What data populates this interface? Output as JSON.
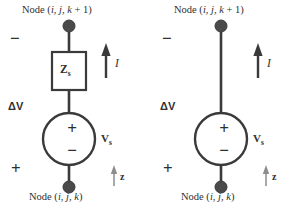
{
  "figure": {
    "type": "circuit-diagram",
    "stroke_color": "#3a3a3a",
    "node_fill_color": "#4a4a4a",
    "background_color": "#ffffff"
  },
  "circuits": [
    {
      "id": "left",
      "has_impedance": true,
      "top_node_label": "Node (i, j, k + 1)",
      "bottom_node_label": "Node (i, j, k)",
      "impedance_label": "Z",
      "impedance_subscript": "s",
      "source_plus": "+",
      "source_minus": "−",
      "source_label": "V",
      "source_subscript": "s",
      "terminal_minus": "−",
      "terminal_plus": "+",
      "delta_v_label": "ΔV",
      "current_label": "I",
      "axis_label": "z"
    },
    {
      "id": "right",
      "has_impedance": false,
      "top_node_label": "Node (i, j, k + 1)",
      "bottom_node_label": "Node (i, j, k)",
      "impedance_label": "",
      "impedance_subscript": "",
      "source_plus": "+",
      "source_minus": "−",
      "source_label": "V",
      "source_subscript": "s",
      "terminal_minus": "−",
      "terminal_plus": "+",
      "delta_v_label": "ΔV",
      "current_label": "I",
      "axis_label": "z"
    }
  ]
}
